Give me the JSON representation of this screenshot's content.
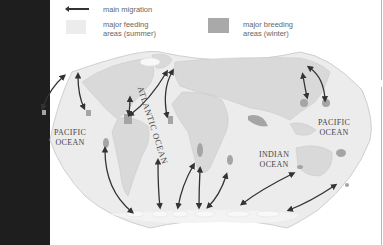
{
  "legend": {
    "migration_label": "main migration",
    "feeding_label_line1": "major feeding",
    "feeding_label_line2": "areas (summer)",
    "breeding_label_line1": "major breeding",
    "breeding_label_line2": "areas (winter)",
    "feeding_color": "#ececec",
    "breeding_color": "#a9a9a9",
    "arrow_color": "#333333"
  },
  "map": {
    "land_color": "#dcdcdc",
    "ocean_color": "#eeeeee",
    "breeding_color": "#a5a5a5",
    "feeding_color": "#f7f7f7",
    "labels": {
      "pacific_west_line1": "PACIFIC",
      "pacific_west_line2": "OCEAN",
      "atlantic": "ATLANTIC OCEAN",
      "indian_line1": "INDIAN",
      "indian_line2": "OCEAN",
      "pacific_east_line1": "PACIFIC",
      "pacific_east_line2": "OCEAN"
    }
  }
}
